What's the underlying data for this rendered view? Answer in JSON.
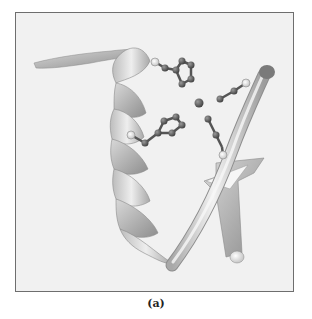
{
  "figure": {
    "caption": "(a)",
    "elements": [
      {
        "type": "alpha-helix",
        "description": "ribbon helix on left side"
      },
      {
        "type": "n-terminal-strand",
        "description": "thin ribbon extending to upper left"
      },
      {
        "type": "coil-tube",
        "description": "tube running diagonally from bottom center to upper right"
      },
      {
        "type": "beta-strand-arrow",
        "description": "flat arrow strand on right side"
      },
      {
        "type": "side-chain",
        "description": "ring side chain (upper)"
      },
      {
        "type": "side-chain",
        "description": "ring side chain (middle left)"
      },
      {
        "type": "side-chain",
        "description": "short side chain (upper right)"
      },
      {
        "type": "side-chain",
        "description": "short side chain (middle right)"
      },
      {
        "type": "metal-ion",
        "description": "central sphere"
      }
    ]
  },
  "colors": {
    "background": "#f1f1f1",
    "frame_border": "#6e6e6e",
    "ribbon_light": "#e6e6e6",
    "ribbon_dark": "#9a9a9a",
    "atom_dark": "#555555",
    "atom_light": "#f4f4f4"
  }
}
